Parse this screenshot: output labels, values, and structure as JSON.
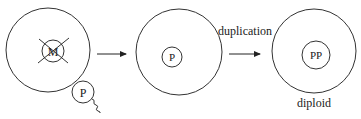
{
  "diagram": {
    "stroke_color": "#333333",
    "cells": [
      {
        "id": "initial-cell",
        "nucleus_label": "M",
        "nucleus_crossed_out": true,
        "attached_label": "P"
      },
      {
        "id": "intermediate-cell",
        "nucleus_label": "P"
      },
      {
        "id": "final-cell",
        "nucleus_label": "PP",
        "caption": "diploid"
      }
    ],
    "arrows": [
      {
        "from": "initial-cell",
        "to": "intermediate-cell",
        "label": ""
      },
      {
        "from": "intermediate-cell",
        "to": "final-cell",
        "label": "duplication"
      }
    ]
  }
}
